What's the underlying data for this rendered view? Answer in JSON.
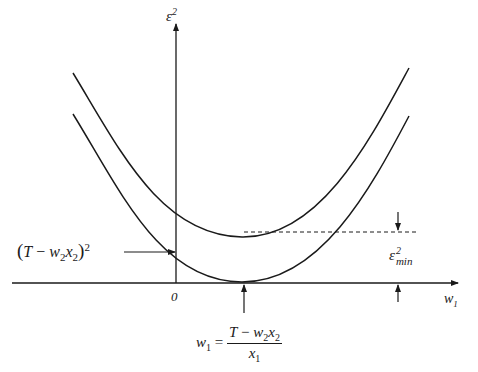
{
  "figure": {
    "colors": {
      "ink": "#1a1a1a",
      "background": "#ffffff"
    },
    "axes": {
      "y_label": {
        "base": "ε",
        "sup": "2"
      },
      "x_label": {
        "base": "w",
        "sub": "1"
      },
      "origin_label": "0"
    },
    "curves": [
      {
        "name": "upper-parabola",
        "min_label": "ε²min offset"
      },
      {
        "name": "lower-parabola",
        "min_value": 0
      }
    ],
    "annotations": {
      "intercept": {
        "open": "(",
        "T": "T",
        "minus": " − ",
        "w": "w",
        "w_sub": "2",
        "x": "x",
        "x_sub": "2",
        "close": ")",
        "sup": "2"
      },
      "emin": {
        "base": "ε",
        "sup": "2",
        "sub": "min"
      },
      "optimum": {
        "lhs_w": "w",
        "lhs_sub": "1",
        "eq": " = ",
        "num_T": "T",
        "num_minus": " − ",
        "num_w": "w",
        "num_w_sub": "2",
        "num_x": "x",
        "num_x_sub": "2",
        "den_x": "x",
        "den_x_sub": "1"
      }
    }
  }
}
